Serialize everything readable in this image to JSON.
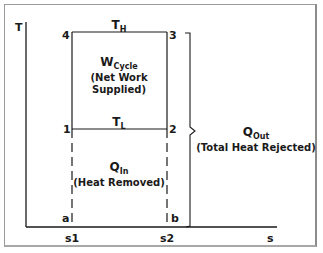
{
  "diagram": {
    "type": "T-s diagram (refrigeration / reversed Carnot cycle)",
    "axes": {
      "y_label": "T",
      "x_label": "s",
      "x_ticks": [
        "s1",
        "s2"
      ]
    },
    "points": {
      "p1": "1",
      "p2": "2",
      "p3": "3",
      "p4": "4",
      "pa": "a",
      "pb": "b"
    },
    "temperatures": {
      "high": {
        "main": "T",
        "sub": "H"
      },
      "low": {
        "main": "T",
        "sub": "L"
      }
    },
    "regions": {
      "work": {
        "main": "W",
        "sub": "Cycle",
        "line1": "(Net Work",
        "line2": "Supplied)"
      },
      "heat_in": {
        "main": "Q",
        "sub": "In",
        "line1": "(Heat Removed)"
      },
      "heat_out": {
        "main": "Q",
        "sub": "Out",
        "line1": "(Total Heat Rejected)"
      }
    },
    "colors": {
      "line": "#1a1a1a",
      "frame": "#9a9a9a",
      "background": "#ffffff"
    }
  }
}
